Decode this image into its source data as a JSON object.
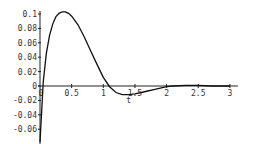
{
  "chart_data": {
    "type": "line",
    "title": "",
    "xlabel": "t",
    "ylabel": "",
    "xlim": [
      0,
      3
    ],
    "ylim": [
      -0.08,
      0.1
    ],
    "grid": false,
    "x_ticks": [
      "0",
      "0.5",
      "1",
      "1.5",
      "2",
      "2.5",
      "3"
    ],
    "y_ticks": [
      "0.1",
      "0.08",
      "0.06",
      "0.04",
      "0.02",
      "0",
      "-0.02",
      "-0.04",
      "-0.06"
    ],
    "series": [
      {
        "name": "response",
        "x": [
          0.0,
          0.05,
          0.1,
          0.15,
          0.2,
          0.25,
          0.3,
          0.35,
          0.4,
          0.45,
          0.5,
          0.6,
          0.7,
          0.8,
          0.9,
          1.0,
          1.1,
          1.2,
          1.3,
          1.4,
          1.5,
          1.6,
          1.7,
          1.8,
          1.9,
          2.0,
          2.1,
          2.3,
          2.5,
          2.7,
          2.9,
          3.0
        ],
        "values": [
          -0.078,
          0.005,
          0.045,
          0.07,
          0.086,
          0.096,
          0.101,
          0.103,
          0.103,
          0.101,
          0.097,
          0.085,
          0.068,
          0.049,
          0.03,
          0.012,
          -0.001,
          -0.009,
          -0.012,
          -0.012,
          -0.011,
          -0.009,
          -0.007,
          -0.005,
          -0.003,
          -0.001,
          0.0,
          0.001,
          0.001,
          0.0,
          0.0,
          0.0
        ]
      }
    ],
    "colors": {
      "curve": "#111111",
      "axis": "#222222"
    }
  },
  "layout": {
    "origin_px": [
      40,
      86
    ],
    "px_per_t": 63.3,
    "px_per_unit_y": 720
  }
}
